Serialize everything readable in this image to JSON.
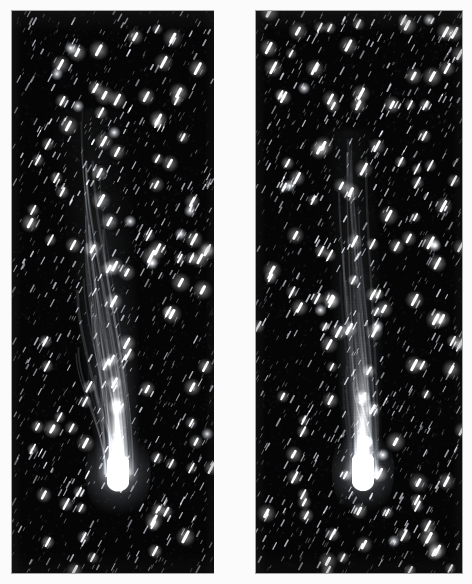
{
  "figure": {
    "kind": "astronomical-photograph",
    "panel_count": 2,
    "background_color": "#fbfbfb",
    "sky_color": "#050505",
    "comet_color": "#ffffff",
    "star_color": "#f2f4ff",
    "caption": ""
  },
  "layout": {
    "canvas_width": 472,
    "canvas_height": 584,
    "gutter_x": 214,
    "gutter_width": 42
  },
  "panels": [
    {
      "id": "left-plate",
      "label": "",
      "x": 12,
      "y": 11,
      "width": 202,
      "height": 562,
      "seed": 1847,
      "star_count": 1050,
      "trail_angle_deg": 62,
      "trail_length": 7.5,
      "comet": {
        "nucleus_x": 118,
        "nucleus_y": 478,
        "nucleus_rx": 11,
        "nucleus_ry": 20,
        "tail_top_y": 110,
        "tail_top_x": 88,
        "tail_top_width": 46,
        "tail_bottom_width": 20,
        "coma_glow_radius": 42,
        "brightness": 1.0,
        "streak_count": 22
      }
    },
    {
      "id": "right-plate",
      "label": "",
      "x": 256,
      "y": 11,
      "width": 206,
      "height": 562,
      "seed": 9321,
      "star_count": 1180,
      "trail_angle_deg": 62,
      "trail_length": 7.5,
      "comet": {
        "nucleus_x": 363,
        "nucleus_y": 477,
        "nucleus_rx": 11,
        "nucleus_ry": 21,
        "tail_top_y": 130,
        "tail_top_x": 348,
        "tail_top_width": 32,
        "tail_bottom_width": 19,
        "coma_glow_radius": 40,
        "brightness": 1.0,
        "streak_count": 18
      }
    }
  ]
}
